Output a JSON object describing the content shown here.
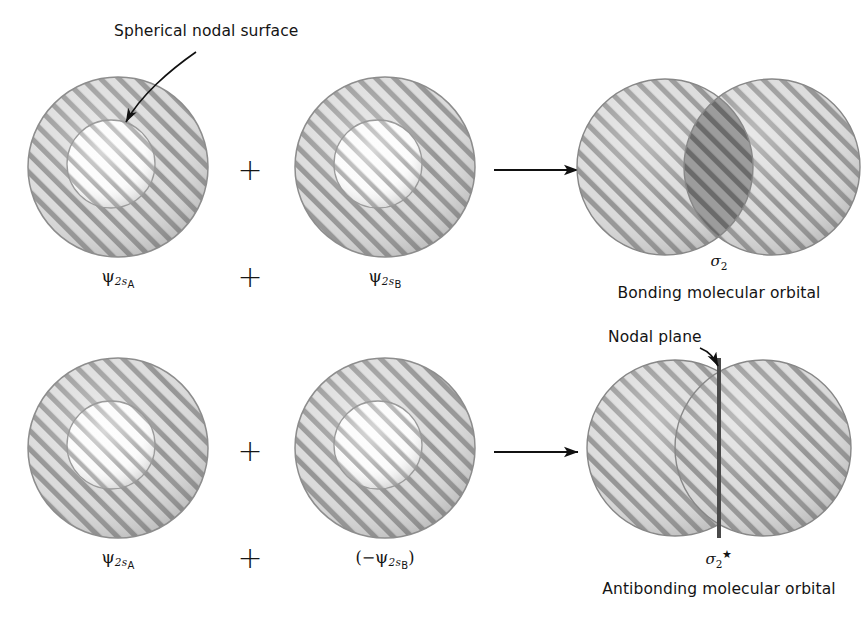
{
  "figure": {
    "title_annotation": "Spherical nodal surface",
    "nodal_plane_annotation": "Nodal plane",
    "plus_symbol": "+",
    "rows": [
      {
        "id": "bonding-row",
        "left_orbital_label_psi": "ψ",
        "left_orbital_label_sub": "2s",
        "left_orbital_label_subsub": "A",
        "middle_orbital_label_psi": "ψ",
        "middle_orbital_label_sub": "2s",
        "middle_orbital_label_subsub": "B",
        "result_symbol_sigma": "σ",
        "result_symbol_sub": "2",
        "result_symbol_star": "",
        "result_caption": "Bonding molecular orbital"
      },
      {
        "id": "antibonding-row",
        "left_orbital_label_psi": "ψ",
        "left_orbital_label_sub": "2s",
        "left_orbital_label_subsub": "A",
        "middle_orbital_label_open": "(−",
        "middle_orbital_label_psi": "ψ",
        "middle_orbital_label_sub": "2s",
        "middle_orbital_label_subsub": "B",
        "middle_orbital_label_close": ")",
        "result_symbol_sigma": "σ",
        "result_symbol_sub": "2",
        "result_symbol_star": "★",
        "result_caption": "Antibonding molecular orbital"
      }
    ],
    "colors": {
      "hatch_line": "#6e6e6e",
      "orbital_fill": "#d2d2d2",
      "inner_fill": "#f0f0f0",
      "overlap_fill": "#9f9f9f",
      "outline": "#8a8a8a",
      "nodal_plane_line": "#4a4a4a",
      "text": "#141414",
      "background": "#ffffff"
    }
  }
}
